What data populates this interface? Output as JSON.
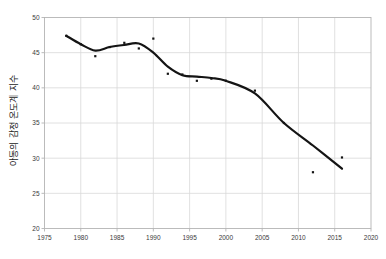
{
  "chart_data": {
    "type": "line",
    "title": "",
    "subtitle": "",
    "xlabel": "",
    "ylabel": "아동의 감정 온도계 지수",
    "xlim": [
      1975,
      2020
    ],
    "ylim": [
      20,
      50
    ],
    "xticks": [
      1975,
      1980,
      1985,
      1990,
      1995,
      2000,
      2005,
      2010,
      2015,
      2020
    ],
    "yticks": [
      20,
      25,
      30,
      35,
      40,
      45,
      50
    ],
    "grid": true,
    "legend": "none",
    "series": [
      {
        "name": "추세선",
        "type": "line",
        "color": "#141414",
        "x": [
          1978,
          1980,
          1982,
          1984,
          1986,
          1988,
          1990,
          1992,
          1994,
          1996,
          1998,
          2000,
          2004,
          2008,
          2012,
          2016
        ],
        "values": [
          47.4,
          46.2,
          45.3,
          45.8,
          46.1,
          46.3,
          45.0,
          43.0,
          41.8,
          41.6,
          41.4,
          41.0,
          39.2,
          35.0,
          31.8,
          28.5
        ]
      },
      {
        "name": "관측치",
        "type": "scatter",
        "color": "#141414",
        "x": [
          1978,
          1980,
          1982,
          1984,
          1986,
          1988,
          1990,
          1992,
          1994,
          1996,
          1998,
          2000,
          2004,
          2008,
          2012,
          2016
        ],
        "values": [
          47.4,
          46.2,
          44.5,
          45.8,
          46.4,
          45.6,
          47.0,
          42.0,
          41.9,
          41.0,
          41.3,
          41.0,
          39.6,
          35.0,
          28.0,
          30.1
        ]
      }
    ],
    "axis_color": "#b4b4b4",
    "grid_color": "#d8d8d8",
    "background": "#ffffff"
  }
}
